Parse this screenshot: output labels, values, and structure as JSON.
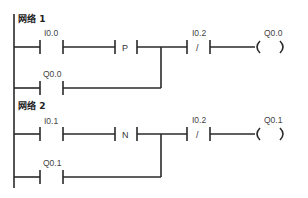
{
  "diagram": {
    "type": "ladder-logic",
    "networks": [
      {
        "title": "网络 1",
        "contact_main": "I0.0",
        "edge": "P",
        "contact_branch": "Q0.0",
        "contact_nc": "I0.2",
        "nc_symbol": "/",
        "coil": "Q0.0"
      },
      {
        "title": "网络 2",
        "contact_main": "I0.1",
        "edge": "N",
        "contact_branch": "Q0.1",
        "contact_nc": "I0.2",
        "nc_symbol": "/",
        "coil": "Q0.1"
      }
    ]
  }
}
